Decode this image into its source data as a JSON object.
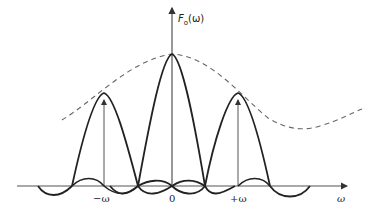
{
  "diagram": {
    "y_axis_label": {
      "main": "F",
      "sub": "o",
      "arg": "(ω)"
    },
    "x_axis_label": "ω",
    "tick_labels": [
      {
        "text": "−ω",
        "x": 100
      },
      {
        "text": "0",
        "x": 172
      },
      {
        "text": "+ω",
        "x": 237
      }
    ],
    "colors": {
      "curve": "#222222",
      "axis": "#555555",
      "envelope": "#666666"
    },
    "components": [
      {
        "name": "center-lobe",
        "center": 0,
        "peak_rel": 1.0
      },
      {
        "name": "left-lobe",
        "center": "-ω",
        "peak_rel": 0.7
      },
      {
        "name": "right-lobe",
        "center": "+ω",
        "peak_rel": 0.7
      }
    ],
    "envelope": {
      "style": "dashed",
      "description": "Gaussian-like envelope through lobe peaks"
    }
  }
}
